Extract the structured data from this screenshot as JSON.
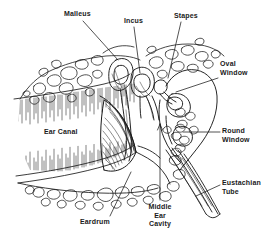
{
  "figure": {
    "style": "black and white pen-and-ink anatomical line drawing",
    "background_color": "#ffffff",
    "ink_color": "#1a1a1a"
  },
  "labels": [
    {
      "id": "malleus",
      "text": "Malleus",
      "x": 64,
      "y": 10,
      "align": "left",
      "leader": {
        "x1": 83,
        "y1": 21,
        "x2": 118,
        "y2": 60
      }
    },
    {
      "id": "incus",
      "text": "Incus",
      "x": 124,
      "y": 17,
      "align": "left",
      "leader": {
        "x1": 134,
        "y1": 27,
        "x2": 140,
        "y2": 73
      }
    },
    {
      "id": "stapes",
      "text": "Stapes",
      "x": 174,
      "y": 12,
      "align": "left",
      "leader": {
        "x1": 181,
        "y1": 22,
        "x2": 168,
        "y2": 78
      }
    },
    {
      "id": "oval-window",
      "text": "Oval\nWindow",
      "x": 220,
      "y": 60,
      "align": "left",
      "leader": {
        "x1": 218,
        "y1": 78,
        "x2": 176,
        "y2": 92
      }
    },
    {
      "id": "round-window",
      "text": "Round\nWindow",
      "x": 222,
      "y": 127,
      "align": "left",
      "leader": {
        "x1": 220,
        "y1": 132,
        "x2": 183,
        "y2": 132
      }
    },
    {
      "id": "eustachian",
      "text": "Eustachian\nTube",
      "x": 222,
      "y": 179,
      "align": "left",
      "leader": {
        "x1": 220,
        "y1": 185,
        "x2": 196,
        "y2": 196
      }
    },
    {
      "id": "ear-canal",
      "text": "Ear Canal",
      "x": 44,
      "y": 128,
      "align": "left",
      "leader": null
    },
    {
      "id": "eardrum",
      "text": "Eardrum",
      "x": 80,
      "y": 218,
      "align": "left",
      "leader": {
        "x1": 110,
        "y1": 216,
        "x2": 131,
        "y2": 172
      }
    },
    {
      "id": "middle-ear",
      "text": "Middle\nEar\nCavity",
      "x": 160,
      "y": 203,
      "align": "center",
      "leader": {
        "x1": 160,
        "y1": 200,
        "x2": 160,
        "y2": 124
      }
    }
  ],
  "structures": [
    "outer ear canal with hatched walls",
    "eardrum (tympanic membrane) cone",
    "malleus",
    "incus",
    "stapes",
    "oval window",
    "round window",
    "middle ear cavity",
    "eustachian tube",
    "cancellous temporal bone"
  ]
}
